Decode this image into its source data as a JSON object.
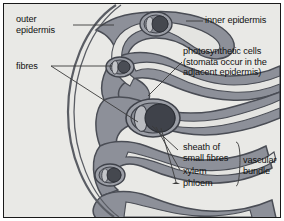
{
  "figure": {
    "background_color": "#e9e9e6",
    "border_color": "#1a1a1a"
  },
  "colors": {
    "background": "#e9e9e6",
    "mesophyll_fill": "#8d9099",
    "mesophyll_outline": "#4a4d55",
    "epidermis_line": "#5a5d64",
    "air_space": "#e4e4e1",
    "bundle_sheath": "#9b9ea6",
    "xylem": "#5c5f68",
    "phloem": "#3f424a",
    "leader_line": "#3a3a3a",
    "text": "#111111"
  },
  "labels": {
    "outer_epidermis": "outer\nepidermis",
    "fibres": "fibres",
    "inner_epidermis": "inner epidermis",
    "photosynthetic_cells": "photosynthetic cells\n(stomata occur in the\nadjacent epidermis)",
    "sheath_of_small_fibres": "sheath of\nsmall fibres",
    "xylem": "xylem",
    "phloem": "phloem",
    "vascular_bundle": "vascular\nbundle"
  },
  "diagram_parts": [
    {
      "name": "outer-epidermis",
      "description": "curved outer boundary arc on the left side of the leaf"
    },
    {
      "name": "inner-epidermis",
      "description": "epidermal line following the folded inner surface"
    },
    {
      "name": "mesophyll",
      "description": "serpentine band of photosynthetic tissue folded in a zig-zag"
    },
    {
      "name": "large-vascular-bundle",
      "description": "central large bundle with sheath, xylem and phloem"
    },
    {
      "name": "small-vascular-bundle",
      "description": "smaller bundles at top, upper-middle and lower areas"
    }
  ]
}
